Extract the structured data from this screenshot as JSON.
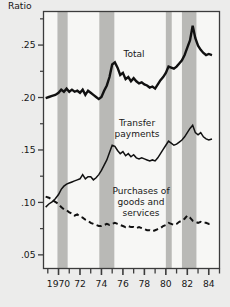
{
  "figure": {
    "background_color": "#ececeb",
    "plot_background_color": "#f7f7f5",
    "frame_color": "#3c3c3c",
    "recession_band_color": "#b9b9b6",
    "line_color": "#111111"
  },
  "axes": {
    "y_axis_title": "Ratio",
    "y_tick_labels": [
      ".25",
      ".20",
      ".15",
      ".10",
      ".05"
    ],
    "y_tick_values": [
      0.25,
      0.2,
      0.15,
      0.1,
      0.05
    ],
    "y_minor_tick_values": [
      0.275,
      0.225,
      0.175,
      0.125,
      0.075
    ],
    "x_tick_labels": [
      "1970",
      "72",
      "74",
      "76",
      "78",
      "80",
      "82",
      "84"
    ],
    "x_tick_values": [
      1970,
      1972,
      1974,
      1976,
      1978,
      1980,
      1982,
      1984
    ],
    "x_minor_tick_values": [
      1969,
      1971,
      1973,
      1975,
      1977,
      1979,
      1981,
      1983,
      1985
    ]
  },
  "series_labels": {
    "total": "Total",
    "transfer_line1": "Transfer",
    "transfer_line2": "payments",
    "purchases_line1": "Purchases of",
    "purchases_line2": "goods and",
    "purchases_line3": "services"
  },
  "chart_data": {
    "type": "line",
    "title": "",
    "xlabel": "",
    "ylabel": "Ratio",
    "xlim": [
      1968.6,
      1985.0
    ],
    "ylim": [
      0.037,
      0.282
    ],
    "grid": false,
    "legend": "inline-annotations",
    "shaded_regions": [
      {
        "label": "recession",
        "x0": 1969.9,
        "x1": 1970.85
      },
      {
        "label": "recession",
        "x0": 1973.8,
        "x1": 1975.2
      },
      {
        "label": "recession",
        "x0": 1980.0,
        "x1": 1980.55
      },
      {
        "label": "recession",
        "x0": 1981.5,
        "x1": 1982.85
      }
    ],
    "series": [
      {
        "name": "Total",
        "style": "solid",
        "linewidth": 2.4,
        "x": [
          1968.8,
          1969.1,
          1969.4,
          1969.7,
          1970.0,
          1970.25,
          1970.5,
          1970.75,
          1971.0,
          1971.25,
          1971.5,
          1971.75,
          1972.0,
          1972.25,
          1972.5,
          1972.75,
          1973.0,
          1973.25,
          1973.5,
          1973.75,
          1974.0,
          1974.25,
          1974.5,
          1974.75,
          1975.0,
          1975.25,
          1975.5,
          1975.75,
          1976.0,
          1976.25,
          1976.5,
          1976.75,
          1977.0,
          1977.25,
          1977.5,
          1977.75,
          1978.0,
          1978.25,
          1978.5,
          1978.75,
          1979.0,
          1979.25,
          1979.5,
          1979.75,
          1980.0,
          1980.25,
          1980.5,
          1980.75,
          1981.0,
          1981.25,
          1981.5,
          1981.75,
          1982.0,
          1982.25,
          1982.5,
          1982.75,
          1983.0,
          1983.25,
          1983.5,
          1983.75,
          1984.0,
          1984.3
        ],
        "y": [
          0.1995,
          0.2005,
          0.2015,
          0.2025,
          0.2045,
          0.2075,
          0.2055,
          0.2085,
          0.2055,
          0.2075,
          0.2055,
          0.2065,
          0.2045,
          0.2075,
          0.2025,
          0.2065,
          0.2045,
          0.2025,
          0.2005,
          0.1985,
          0.2005,
          0.2065,
          0.2115,
          0.2195,
          0.2315,
          0.2335,
          0.2285,
          0.2215,
          0.2235,
          0.2175,
          0.2195,
          0.2155,
          0.2185,
          0.2155,
          0.2135,
          0.2145,
          0.2125,
          0.2115,
          0.2095,
          0.2105,
          0.2085,
          0.2125,
          0.2165,
          0.2195,
          0.2235,
          0.2295,
          0.2285,
          0.2275,
          0.2295,
          0.2325,
          0.2355,
          0.2405,
          0.2475,
          0.2545,
          0.2685,
          0.2565,
          0.2495,
          0.2455,
          0.2425,
          0.2405,
          0.2415,
          0.2405
        ]
      },
      {
        "name": "Transfer payments",
        "style": "solid",
        "linewidth": 1.5,
        "x": [
          1968.8,
          1969.1,
          1969.4,
          1969.7,
          1970.0,
          1970.25,
          1970.5,
          1970.75,
          1971.0,
          1971.25,
          1971.5,
          1971.75,
          1972.0,
          1972.25,
          1972.5,
          1972.75,
          1973.0,
          1973.25,
          1973.5,
          1973.75,
          1974.0,
          1974.25,
          1974.5,
          1974.75,
          1975.0,
          1975.25,
          1975.5,
          1975.75,
          1976.0,
          1976.25,
          1976.5,
          1976.75,
          1977.0,
          1977.25,
          1977.5,
          1977.75,
          1978.0,
          1978.25,
          1978.5,
          1978.75,
          1979.0,
          1979.25,
          1979.5,
          1979.75,
          1980.0,
          1980.25,
          1980.5,
          1980.75,
          1981.0,
          1981.25,
          1981.5,
          1981.75,
          1982.0,
          1982.25,
          1982.5,
          1982.75,
          1983.0,
          1983.25,
          1983.5,
          1983.75,
          1984.0,
          1984.3
        ],
        "y": [
          0.0955,
          0.0985,
          0.1005,
          0.1035,
          0.1075,
          0.1125,
          0.1155,
          0.1175,
          0.1185,
          0.1195,
          0.1205,
          0.1215,
          0.1225,
          0.1265,
          0.1225,
          0.1245,
          0.1245,
          0.1215,
          0.1235,
          0.1265,
          0.1305,
          0.1355,
          0.1405,
          0.1475,
          0.1545,
          0.1535,
          0.1495,
          0.1465,
          0.1485,
          0.1445,
          0.1465,
          0.1435,
          0.1455,
          0.1425,
          0.1415,
          0.1425,
          0.1415,
          0.1405,
          0.1395,
          0.1405,
          0.1395,
          0.1425,
          0.1465,
          0.1505,
          0.1545,
          0.1585,
          0.1565,
          0.1545,
          0.1555,
          0.1575,
          0.1595,
          0.1625,
          0.1665,
          0.1705,
          0.1735,
          0.1665,
          0.1645,
          0.1665,
          0.1625,
          0.1605,
          0.1595,
          0.1605
        ]
      },
      {
        "name": "Purchases of goods and services",
        "style": "dashed",
        "linewidth": 2.0,
        "x": [
          1968.8,
          1969.1,
          1969.4,
          1969.7,
          1970.0,
          1970.25,
          1970.5,
          1970.75,
          1971.0,
          1971.25,
          1971.5,
          1971.75,
          1972.0,
          1972.25,
          1972.5,
          1972.75,
          1973.0,
          1973.25,
          1973.5,
          1973.75,
          1974.0,
          1974.25,
          1974.5,
          1974.75,
          1975.0,
          1975.25,
          1975.5,
          1975.75,
          1976.0,
          1976.25,
          1976.5,
          1976.75,
          1977.0,
          1977.25,
          1977.5,
          1977.75,
          1978.0,
          1978.25,
          1978.5,
          1978.75,
          1979.0,
          1979.25,
          1979.5,
          1979.75,
          1980.0,
          1980.25,
          1980.5,
          1980.75,
          1981.0,
          1981.25,
          1981.5,
          1981.75,
          1982.0,
          1982.25,
          1982.5,
          1982.75,
          1983.0,
          1983.25,
          1983.5,
          1983.75,
          1984.0,
          1984.3
        ],
        "y": [
          0.1055,
          0.1045,
          0.1025,
          0.1005,
          0.0985,
          0.0955,
          0.0935,
          0.0925,
          0.0905,
          0.0895,
          0.0875,
          0.0885,
          0.0865,
          0.0855,
          0.0835,
          0.0825,
          0.0805,
          0.0795,
          0.0785,
          0.0775,
          0.0775,
          0.0785,
          0.0795,
          0.0785,
          0.0795,
          0.0805,
          0.0795,
          0.0785,
          0.0775,
          0.0765,
          0.0775,
          0.0765,
          0.0765,
          0.0755,
          0.0765,
          0.0755,
          0.0745,
          0.0735,
          0.0735,
          0.0725,
          0.0735,
          0.0745,
          0.0755,
          0.0775,
          0.0785,
          0.0805,
          0.0795,
          0.0785,
          0.0795,
          0.0815,
          0.0825,
          0.0845,
          0.0875,
          0.0855,
          0.0825,
          0.0815,
          0.0805,
          0.0815,
          0.0805,
          0.0805,
          0.0795,
          0.0805
        ]
      }
    ]
  }
}
